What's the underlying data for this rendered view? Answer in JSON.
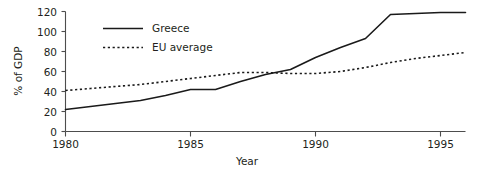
{
  "chart_data": {
    "type": "line",
    "title": "",
    "xlabel": "Year",
    "ylabel": "% of GDP",
    "xlim": [
      1980,
      1996
    ],
    "ylim": [
      0,
      120
    ],
    "grid": false,
    "legend_position": "top-left-inside",
    "xticks": [
      1980,
      1985,
      1990,
      1995
    ],
    "xtick_labels": [
      "1980",
      "1985",
      "1990",
      "1995"
    ],
    "yticks": [
      0,
      20,
      40,
      60,
      80,
      100,
      120
    ],
    "ytick_labels": [
      "0",
      "20",
      "40",
      "60",
      "80",
      "100",
      "120"
    ],
    "x": [
      1980,
      1981,
      1982,
      1983,
      1984,
      1985,
      1986,
      1987,
      1988,
      1989,
      1990,
      1991,
      1992,
      1993,
      1994,
      1995,
      1996
    ],
    "series": [
      {
        "name": "Greece",
        "style": "solid",
        "color": "#1a1a1a",
        "values": [
          22,
          25,
          28,
          31,
          36,
          42,
          42,
          50,
          57,
          62,
          74,
          84,
          93,
          117,
          118,
          119,
          119
        ]
      },
      {
        "name": "EU average",
        "style": "dotted",
        "color": "#1a1a1a",
        "values": [
          41,
          43,
          45,
          47,
          50,
          53,
          56,
          59,
          59,
          58,
          58,
          60,
          64,
          69,
          73,
          76,
          79
        ]
      }
    ],
    "annotations": []
  },
  "legend": {
    "items": [
      {
        "label": "Greece",
        "style": "solid"
      },
      {
        "label": "EU average",
        "style": "dotted"
      }
    ]
  },
  "axes": {
    "x_title": "Year",
    "y_title": "% of GDP"
  }
}
